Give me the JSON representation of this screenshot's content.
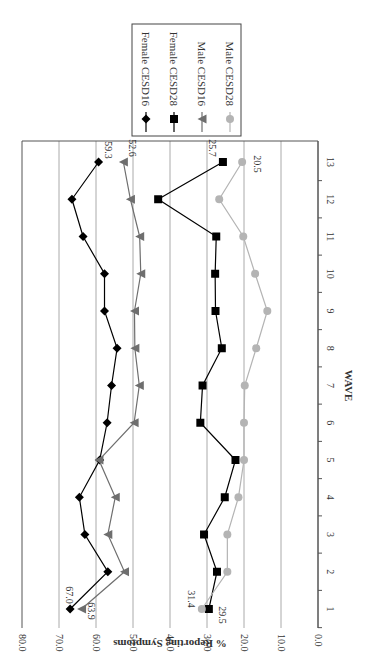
{
  "chart_data": {
    "type": "line",
    "orientation": "rotated 90 degrees clockwise (page-rotated figure)",
    "title": "",
    "xlabel": "WAVE",
    "ylabel": "% Reporting Symptoms",
    "x": [
      1,
      2,
      3,
      4,
      5,
      6,
      7,
      8,
      9,
      10,
      11,
      12,
      13
    ],
    "xticks": [
      "1",
      "2",
      "3",
      "4",
      "5",
      "6",
      "7",
      "8",
      "9",
      "10",
      "11",
      "12",
      "13"
    ],
    "ylim": [
      0,
      80
    ],
    "yticks": [
      "0.0",
      "10.0",
      "20.0",
      "30.0",
      "40.0",
      "50.0",
      "60.0",
      "70.0",
      "80.0"
    ],
    "grid": true,
    "legend_position": "upper-right (in rotated view: top-right box)",
    "series": [
      {
        "name": "Female CESD16",
        "marker": "diamond",
        "color": "#000000",
        "values": [
          67.0,
          56.8,
          63.0,
          64.5,
          59.0,
          57.0,
          55.8,
          54.3,
          57.7,
          57.7,
          63.5,
          66.5,
          59.3
        ]
      },
      {
        "name": "Female CESD28",
        "marker": "square",
        "color": "#000000",
        "values": [
          29.5,
          27.3,
          30.8,
          25.2,
          22.3,
          31.8,
          31.2,
          26.0,
          27.7,
          27.8,
          27.5,
          43.2,
          25.7
        ]
      },
      {
        "name": "Male CESD16",
        "marker": "triangle",
        "color": "#6e6e6e",
        "values": [
          63.9,
          52.3,
          56.8,
          54.8,
          59.2,
          49.7,
          48.3,
          49.5,
          49.6,
          47.9,
          48.2,
          50.7,
          52.6
        ]
      },
      {
        "name": "Male CESD28",
        "marker": "circle",
        "color": "#b4b4b4",
        "values": [
          31.4,
          24.5,
          24.5,
          21.5,
          20.0,
          20.0,
          19.8,
          16.7,
          13.7,
          17.0,
          20.2,
          26.7,
          20.5
        ]
      }
    ],
    "annotations": [
      {
        "series": "Female CESD16",
        "wave": 1,
        "text": "67.0"
      },
      {
        "series": "Male CESD16",
        "wave": 1,
        "text": "63.9"
      },
      {
        "series": "Male CESD28",
        "wave": 1,
        "text": "31.4"
      },
      {
        "series": "Female CESD28",
        "wave": 1,
        "text": "29.5"
      },
      {
        "series": "Female CESD16",
        "wave": 13,
        "text": "59.3"
      },
      {
        "series": "Male CESD16",
        "wave": 13,
        "text": "52.6"
      },
      {
        "series": "Female CESD28",
        "wave": 13,
        "text": "25.7"
      },
      {
        "series": "Male CESD28",
        "wave": 13,
        "text": "20.5"
      }
    ]
  }
}
